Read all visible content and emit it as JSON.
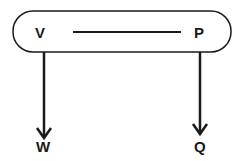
{
  "diagram": {
    "nodes": {
      "v": {
        "label": "V"
      },
      "p": {
        "label": "P"
      },
      "w": {
        "label": "W"
      },
      "q": {
        "label": "Q"
      }
    },
    "edges": [
      {
        "from": "V",
        "to": "P",
        "type": "line"
      },
      {
        "from": "V",
        "to": "W",
        "type": "arrow"
      },
      {
        "from": "P",
        "to": "Q",
        "type": "arrow"
      }
    ],
    "colors": {
      "stroke": "#1a1a1a",
      "background": "#ffffff"
    }
  }
}
